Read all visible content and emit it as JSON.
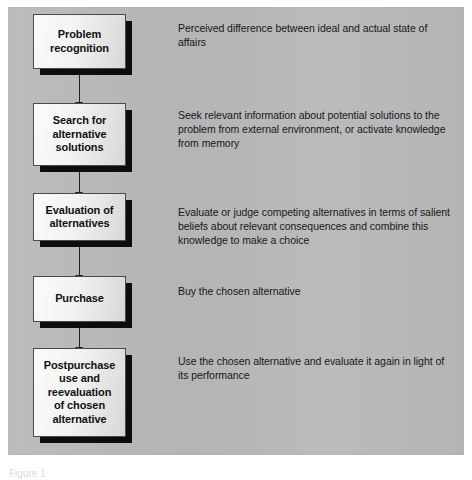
{
  "figure": {
    "background_color": "#ffffff",
    "panel_color": "#b8b8b8",
    "node_border_color": "#4a4a4a",
    "node_shadow_color": "#0d0d0d",
    "arrow_color": "#222222",
    "text_color": "#17171a",
    "caption": "Figure 1"
  },
  "flow": {
    "steps": [
      {
        "label": "Problem\nrecognition",
        "description": "Perceived difference between ideal and actual state of affairs"
      },
      {
        "label": "Search for\nalternative\nsolutions",
        "description": "Seek relevant information about potential solutions to the problem from external environment, or activate knowledge from memory"
      },
      {
        "label": "Evaluation of\nalternatives",
        "description": "Evaluate or judge competing alternatives in terms of salient beliefs about relevant consequences and combine this knowledge to make a choice"
      },
      {
        "label": "Purchase",
        "description": "Buy the chosen alternative"
      },
      {
        "label": "Postpurchase\nuse and\nreevaluation\nof chosen\nalternative",
        "description": "Use the chosen alternative and evaluate it again in light of its performance"
      }
    ]
  }
}
